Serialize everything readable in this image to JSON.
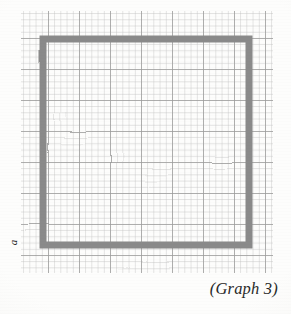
{
  "page": {
    "background_color": "#fdfdfc",
    "width": 291,
    "height": 314
  },
  "caption": {
    "text": "(Graph 3)",
    "color": "#2a2a2a",
    "style": "italic-serif",
    "position": "bottom-right"
  },
  "axis_label": {
    "text": "a",
    "color": "#1a1a1a",
    "style": "italic-serif-rotated",
    "rotation_degrees": -90,
    "position": "left-lower"
  },
  "grid": {
    "name": "graph-paper-grid",
    "minor_line_color": "#b9b9b9",
    "major_line_color": "#8f8f8f",
    "minor_spacing_px": 6.2,
    "major_every_n_cells": 5,
    "left_px": 21,
    "top_px": 11,
    "width_px": 252,
    "height_px": 262
  },
  "chart_data": {
    "type": "line",
    "title": "(Graph 3)",
    "xlabel": "",
    "ylabel": "a",
    "grid": true,
    "legend": "none",
    "shapes": [
      {
        "name": "gray-rectangle-path",
        "kind": "polyline",
        "stroke_color": "#8a8a8a",
        "stroke_width_px": 7,
        "closed": true,
        "points_px": [
          [
            43,
            39
          ],
          [
            249,
            39
          ],
          [
            249,
            245
          ],
          [
            43,
            245
          ]
        ]
      },
      {
        "name": "black-segment-marker",
        "kind": "segment",
        "stroke_color": "#141414",
        "stroke_width_px": 9,
        "start_px": [
          46,
          244
        ],
        "end_px": [
          82,
          244
        ],
        "rounded_caps": true
      }
    ],
    "axis_ranges": {
      "x": [
        0,
        40
      ],
      "y": [
        0,
        42
      ]
    }
  }
}
